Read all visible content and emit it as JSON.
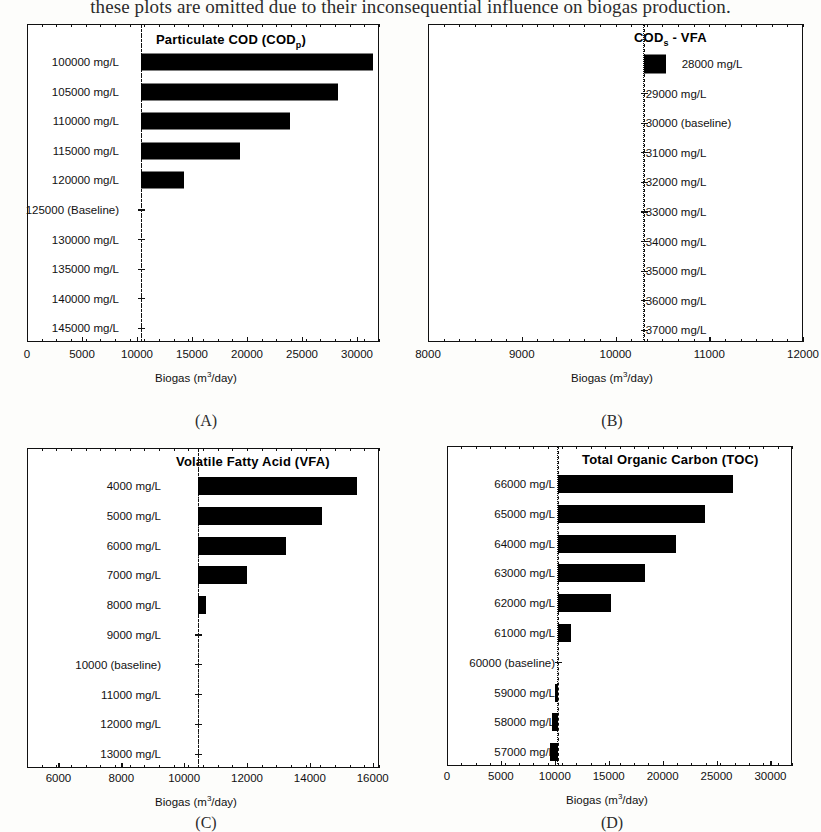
{
  "figure": {
    "top_caption": "these plots are omitted due to their inconsequential influence on biogas production.",
    "axis_title": "Biogas (m³/day)",
    "axis_title_base": "Biogas (m",
    "axis_title_sup": "3",
    "axis_title_tail": "/day)",
    "ink_color": "#000000"
  },
  "chart_data": [
    {
      "type": "bar",
      "panel": "(A)",
      "title": "Particulate COD (CODp)",
      "title_main": "Particulate COD (COD",
      "title_sub": "p",
      "title_end": ")",
      "orientation": "horizontal",
      "xlabel": "Biogas (m3/day)",
      "ylabel": "",
      "xlim": [
        0,
        32000
      ],
      "xticks": [
        0,
        5000,
        10000,
        15000,
        20000,
        25000,
        30000
      ],
      "xticklabels": [
        "0",
        "5000",
        "10000",
        "15000",
        "20000",
        "25000",
        "30000"
      ],
      "baseline_value": 10400,
      "baseline_category": "125000 (Baseline)",
      "grid": false,
      "legend": "none",
      "categories": [
        "100000 mg/L",
        "105000 mg/L",
        "110000 mg/L",
        "115000 mg/L",
        "120000 mg/L",
        "125000 (Baseline)",
        "130000 mg/L",
        "135000 mg/L",
        "140000 mg/L",
        "145000 mg/L"
      ],
      "values": [
        31500,
        28300,
        23900,
        19400,
        14300,
        10400,
        10400,
        10400,
        10400,
        10400
      ]
    },
    {
      "type": "bar",
      "panel": "(B)",
      "title": "CODs - VFA",
      "title_main": "COD",
      "title_sub": "s",
      "title_end": " - VFA",
      "orientation": "horizontal",
      "xlabel": "Biogas (m3/day)",
      "ylabel": "",
      "xlim": [
        8000,
        12000
      ],
      "xticks": [
        8000,
        9000,
        10000,
        11000,
        12000
      ],
      "xticklabels": [
        "8000",
        "9000",
        "10000",
        "11000",
        "12000"
      ],
      "baseline_value": 10300,
      "baseline_category": "30000 (baseline)",
      "grid": false,
      "legend": "none",
      "categories": [
        "28000 mg/L",
        "29000 mg/L",
        "30000 (baseline)",
        "31000 mg/L",
        "32000 mg/L",
        "33000 mg/L",
        "34000 mg/L",
        "35000 mg/L",
        "36000 mg/L",
        "37000 mg/L"
      ],
      "values": [
        10540,
        10300,
        10300,
        10300,
        10300,
        10300,
        10300,
        10300,
        10300,
        10300
      ]
    },
    {
      "type": "bar",
      "panel": "(C)",
      "title": "Volatile Fatty Acid (VFA)",
      "title_main": "Volatile Fatty Acid (VFA)",
      "title_sub": "",
      "title_end": "",
      "orientation": "horizontal",
      "xlabel": "Biogas (m3/day)",
      "ylabel": "",
      "xlim": [
        5000,
        16200
      ],
      "xticks": [
        6000,
        8000,
        10000,
        12000,
        14000,
        16000
      ],
      "xticklabels": [
        "6000",
        "8000",
        "10000",
        "12000",
        "14000",
        "16000"
      ],
      "baseline_value": 10450,
      "baseline_category": "10000 (baseline)",
      "grid": false,
      "legend": "none",
      "categories": [
        "4000 mg/L",
        "5000 mg/L",
        "6000 mg/L",
        "7000 mg/L",
        "8000 mg/L",
        "9000 mg/L",
        "10000 (baseline)",
        "11000 mg/L",
        "12000 mg/L",
        "13000 mg/L"
      ],
      "values": [
        15500,
        14400,
        13250,
        12000,
        10700,
        10450,
        10450,
        10450,
        10450,
        10450
      ]
    },
    {
      "type": "bar",
      "panel": "(D)",
      "title": "Total Organic Carbon (TOC)",
      "title_main": "Total Organic Carbon (TOC)",
      "title_sub": "",
      "title_end": "",
      "orientation": "horizontal",
      "xlabel": "Biogas (m3/day)",
      "ylabel": "",
      "xlim": [
        0,
        32000
      ],
      "xticks": [
        0,
        5000,
        10000,
        15000,
        20000,
        25000,
        30000
      ],
      "xticklabels": [
        "0",
        "5000",
        "10000",
        "15000",
        "20000",
        "25000",
        "30000"
      ],
      "baseline_value": 10300,
      "baseline_category": "60000 (baseline)",
      "grid": false,
      "legend": "none",
      "categories": [
        "66000 mg/L",
        "65000 mg/L",
        "64000 mg/L",
        "63000 mg/L",
        "62000 mg/L",
        "61000 mg/L",
        "60000 (baseline)",
        "59000 mg/L",
        "58000 mg/L",
        "57000 mg/L"
      ],
      "values": [
        26500,
        23900,
        21200,
        18400,
        15200,
        11500,
        10300,
        10050,
        9750,
        9550
      ]
    }
  ]
}
